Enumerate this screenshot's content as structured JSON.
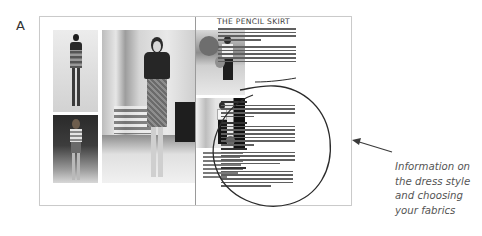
{
  "figure": {
    "label": "A"
  },
  "spread": {
    "right_page": {
      "title": "THE PENCIL SKIRT",
      "sections": [
        {
          "heading": "",
          "lines": 4
        },
        {
          "heading": "",
          "lines": 5
        },
        {
          "heading": "The characteristics",
          "lines": 4
        },
        {
          "heading": "Who wears it well?",
          "lines": 6
        },
        {
          "heading": "Suitable fabrics",
          "lines": 4
        },
        {
          "heading": "Styling tips",
          "lines": 5
        }
      ]
    },
    "left_page": {
      "photos": [
        "model-strapless-patterned-dress",
        "woman-dark-top-tweed-pencil-skirt",
        "woman-striped-top-short-skirt"
      ]
    },
    "right_page_photos": [
      "woman-white-top-black-pencil-skirt-outdoors",
      "woman-white-top-black-pencil-skirt-doorway"
    ],
    "photo_caption_lines": 7
  },
  "callout": {
    "shape": "hand-drawn-circle",
    "arrow": "arrow-pointing-left",
    "text_lines": [
      "Information on",
      "the dress style",
      "and choosing",
      "your fabrics"
    ],
    "text_color": "#555555",
    "stroke_color": "#2b2b2b"
  }
}
